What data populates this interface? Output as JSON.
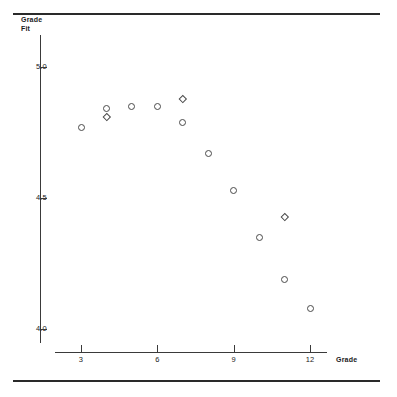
{
  "figure": {
    "y_axis_title": "Grade\nFit",
    "x_axis_title": "Grade"
  },
  "chart_data": {
    "type": "scatter",
    "title": "",
    "subtitle": "",
    "xlabel": "Grade",
    "ylabel": "Grade Fit",
    "xlim": [
      1.8,
      13.0
    ],
    "ylim": [
      3.92,
      5.12
    ],
    "grid": false,
    "legend": null,
    "xticks": [
      3,
      6,
      9,
      12
    ],
    "xticklabels": [
      "3",
      "6",
      "9",
      "12"
    ],
    "yticks": [
      5.0,
      4.5,
      4.0
    ],
    "yticklabels": [
      "5.0",
      "4.5",
      "4.0"
    ],
    "series": [
      {
        "name": "Grade Fit (circle markers)",
        "marker": "circle",
        "points": [
          {
            "x": 3,
            "y": 4.77
          },
          {
            "x": 4,
            "y": 4.84
          },
          {
            "x": 5,
            "y": 4.85
          },
          {
            "x": 6,
            "y": 4.85
          },
          {
            "x": 7,
            "y": 4.79
          },
          {
            "x": 8,
            "y": 4.67
          },
          {
            "x": 9,
            "y": 4.53
          },
          {
            "x": 10,
            "y": 4.35
          },
          {
            "x": 11,
            "y": 4.19
          },
          {
            "x": 12,
            "y": 4.08
          }
        ]
      },
      {
        "name": "Grade Fit (diamond markers)",
        "marker": "diamond",
        "points": [
          {
            "x": 4,
            "y": 4.81
          },
          {
            "x": 7,
            "y": 4.88
          },
          {
            "x": 11,
            "y": 4.43
          }
        ]
      }
    ]
  }
}
